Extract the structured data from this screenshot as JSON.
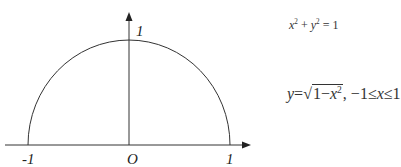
{
  "diagram": {
    "type": "unit-semicircle",
    "axis_labels": {
      "x_neg": "-1",
      "origin": "O",
      "x_pos": "1",
      "y_top": "1"
    },
    "equations": {
      "circle": {
        "lhs_x": "x",
        "exp_x": "2",
        "plus": " + ",
        "lhs_y": "y",
        "exp_y": "2",
        "rhs": " = 1"
      },
      "function": {
        "y": "y",
        "eq": "=",
        "sqrt_symbol": "√",
        "radicand_one": "1−",
        "radicand_x": "x",
        "radicand_exp": "2",
        "comma": ", −1≤",
        "var": "x",
        "upper": "≤1"
      }
    },
    "curve": {
      "shape": "upper-half-circle",
      "center": [
        0,
        0
      ],
      "radius": 1,
      "domain": [
        -1,
        1
      ]
    }
  }
}
